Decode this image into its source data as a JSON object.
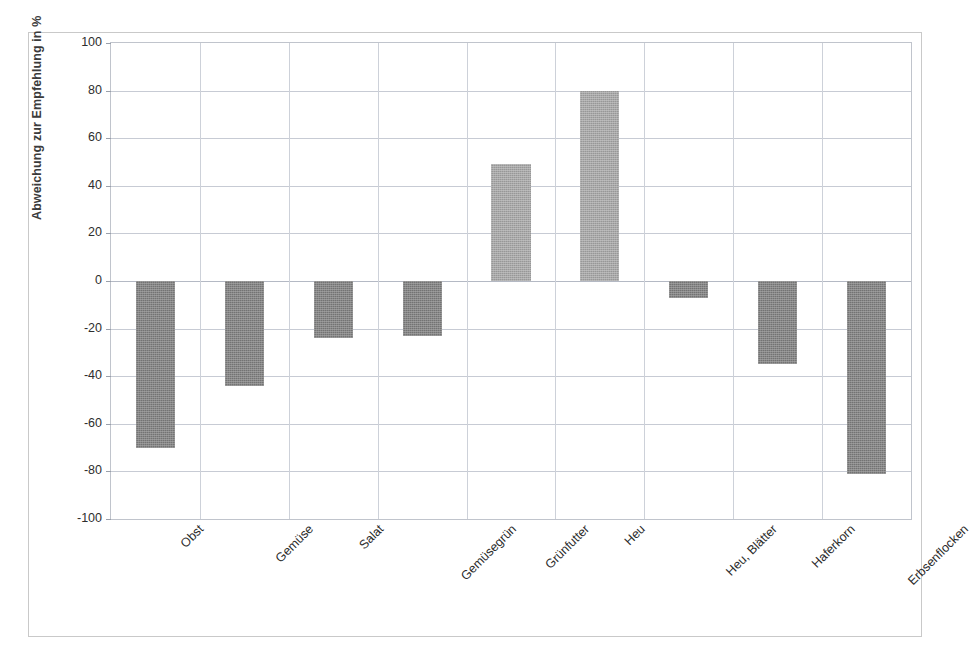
{
  "chart_data": {
    "type": "bar",
    "title": "",
    "xlabel": "",
    "ylabel": "Abweichung zur Empfehlung in %",
    "ylim": [
      -100,
      100
    ],
    "ytick_step": 20,
    "yticks": [
      100,
      80,
      60,
      40,
      20,
      0,
      -20,
      -40,
      -60,
      -80,
      -100
    ],
    "ytick_labels": [
      "100",
      "80",
      "60",
      "40",
      "20",
      "0",
      "-20",
      "-40",
      "-60",
      "-80",
      "-100"
    ],
    "grid": true,
    "grid_axes": "both",
    "legend": false,
    "legend_position": "none",
    "categories": [
      "Obst",
      "Gemüse",
      "Salat",
      "Gemüsegrün",
      "Grünfutter",
      "Heu",
      "Heu, Blätter",
      "Haferkorn",
      "Erbsenflocken"
    ],
    "values": [
      -70,
      -44,
      -24,
      -23,
      49,
      80,
      -7,
      -35,
      -81
    ],
    "value_unit": "%",
    "bar_colors": [
      "#818181",
      "#818181",
      "#818181",
      "#818181",
      "#a9a9a9",
      "#a9a9a9",
      "#818181",
      "#818181",
      "#818181"
    ],
    "colors": {
      "negative_bar": "#818181",
      "positive_bar": "#a9a9a9",
      "gridline": "#c7cbd4",
      "plot_border": "#c0c4cc",
      "figure_border": "#c9c9c9",
      "text": "#2e2e2e",
      "axis_title": "#3b3b3b",
      "background": "#ffffff"
    }
  }
}
